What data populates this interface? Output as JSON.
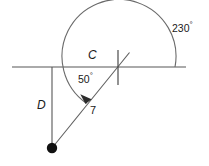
{
  "figure": {
    "type": "geometry-diagram",
    "background_color": "#ffffff",
    "stroke_color": "#4d4d4d",
    "text_color": "#1a1a1a",
    "width": 209,
    "height": 166
  },
  "labels": {
    "arc_label": "C",
    "angle_interior": "50",
    "angle_arc": "230",
    "degree_symbol": "°",
    "vertical_segment": "D",
    "diagonal_segment": "7"
  },
  "geometry": {
    "horizontal_line": {
      "x1": 12,
      "y1": 67,
      "x2": 186,
      "y2": 67
    },
    "vertical_line": {
      "x1": 52,
      "y1": 67,
      "x2": 52,
      "y2": 148
    },
    "diagonal_line": {
      "x1": 52,
      "y1": 148,
      "x2": 129,
      "y2": 53
    },
    "tick_mark": {
      "x1": 118,
      "y1": 50,
      "x2": 118,
      "y2": 85
    },
    "vertex_point": {
      "cx": 52,
      "cy": 148,
      "r": 5
    },
    "arc": {
      "center_x": 118,
      "center_y": 67,
      "radius": 57,
      "sweep_degrees": 230,
      "start_point": {
        "x": 175,
        "y": 67
      },
      "end_point": {
        "x": 85,
        "y": 102
      }
    }
  },
  "annotations": {
    "arc_measure_degrees": 230,
    "interior_angle_degrees": 50,
    "chord_length": 7,
    "distance_label": "D",
    "circumference_label": "C"
  }
}
